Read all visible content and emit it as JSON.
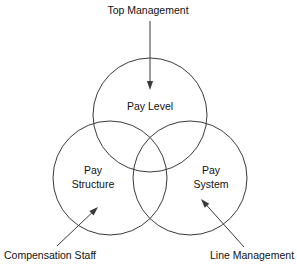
{
  "diagram": {
    "type": "venn-three-circle",
    "background_color": "#ffffff",
    "stroke_color": "#3a3a3a",
    "text_color": "#111111",
    "circles": [
      {
        "id": "pay-level",
        "label_line1": "Pay Level",
        "label_line2": "",
        "cx": 150,
        "cy": 115,
        "r": 57,
        "position": "top"
      },
      {
        "id": "pay-structure",
        "label_line1": "Pay",
        "label_line2": "Structure",
        "cx": 110,
        "cy": 178,
        "r": 57,
        "position": "bottom-left"
      },
      {
        "id": "pay-system",
        "label_line1": "Pay",
        "label_line2": "System",
        "cx": 190,
        "cy": 178,
        "r": 57,
        "position": "bottom-right"
      }
    ],
    "annotations": [
      {
        "id": "top-management",
        "text": "Top Management",
        "points_to": "pay-level",
        "text_x": 148,
        "text_y": 14,
        "anchor": "middle",
        "arrow_from_x": 150,
        "arrow_from_y": 21,
        "arrow_to_x": 150,
        "arrow_to_y": 90
      },
      {
        "id": "compensation-staff",
        "text": "Compensation Staff",
        "points_to": "pay-structure",
        "text_x": 4,
        "text_y": 259,
        "anchor": "start",
        "arrow_from_x": 57,
        "arrow_from_y": 246,
        "arrow_to_x": 98,
        "arrow_to_y": 207
      },
      {
        "id": "line-management",
        "text": "Line Management",
        "points_to": "pay-system",
        "text_x": 210,
        "text_y": 259,
        "anchor": "start",
        "arrow_from_x": 244,
        "arrow_from_y": 247,
        "arrow_to_x": 201,
        "arrow_to_y": 199
      }
    ]
  }
}
